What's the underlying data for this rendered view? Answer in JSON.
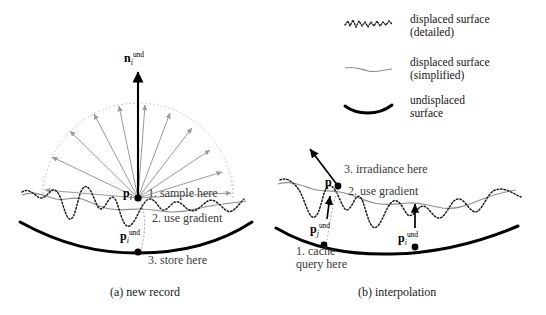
{
  "figure": {
    "type": "diagram"
  },
  "legend": {
    "items": [
      {
        "swatch": "dotted-wavy-line-swatch",
        "line1": "displaced surface",
        "line2": "(detailed)",
        "color": "#1f1f1f",
        "style": "dotted"
      },
      {
        "swatch": "thin-gray-wavy-line-swatch",
        "line1": "displaced surface",
        "line2": "(simplified)",
        "color": "#8d8d8d",
        "style": "solid-thin"
      },
      {
        "swatch": "thick-black-curve-swatch",
        "line1": "undisplaced",
        "line2": "surface",
        "color": "#000000",
        "style": "solid-thick"
      }
    ]
  },
  "panel_a": {
    "caption": "(a) new record",
    "normal_label": {
      "symbol": "n",
      "subscript": "i",
      "superscript": "und"
    },
    "point_surface": {
      "symbol": "p",
      "subscript": "i",
      "superscript": ""
    },
    "point_undisplaced": {
      "symbol": "p",
      "subscript": "i",
      "superscript": "und"
    },
    "steps": [
      "1. sample here",
      "2. use gradient",
      "3. store here"
    ],
    "ray_count": 11,
    "colors": {
      "ray": "#9a9a9a",
      "hemisphere": "#b4b4b4",
      "normal": "#000000"
    }
  },
  "panel_b": {
    "caption": "(b) interpolation",
    "point_surface": {
      "symbol": "p",
      "subscript": "",
      "superscript": ""
    },
    "point_undisplaced_left": {
      "symbol": "p",
      "subscript": "j",
      "superscript": "und"
    },
    "point_undisplaced_right": {
      "symbol": "p",
      "subscript": "i",
      "superscript": "und"
    },
    "steps": [
      "1. cache",
      "query here",
      "2. use gradient",
      "3. irradiance here"
    ],
    "colors": {
      "arrow": "#000000"
    }
  },
  "palette": {
    "background": "#ffffff",
    "detailed_surface": "#1f1f1f",
    "simplified_surface": "#8d8d8d",
    "undisplaced_surface": "#000000",
    "ray_gray": "#9a9a9a",
    "text": "#1a1a1a"
  }
}
